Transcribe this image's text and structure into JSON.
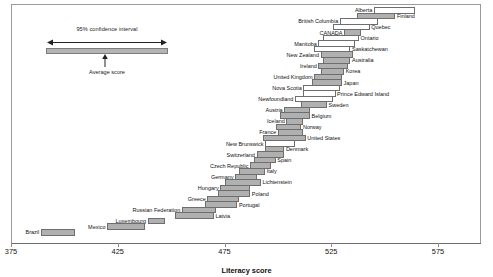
{
  "chart_data": {
    "type": "bar",
    "title": "",
    "subtitle": "",
    "xlabel": "Literacy score",
    "ylabel": "",
    "xlim": [
      375,
      585
    ],
    "xticks": [
      375,
      425,
      475,
      525,
      575
    ],
    "xticklabels": [
      "375",
      "425",
      "475",
      "525",
      "575"
    ],
    "grid": false,
    "legend_position": "top-left",
    "orientation": "horizontal",
    "value_encoding": "95% confidence interval band around average score",
    "legend": {
      "ci_label": "95% confidence interval",
      "avg_label": "Average score"
    },
    "categories": [
      "Alberta",
      "Finland",
      "British Columbia",
      "Quebec",
      "CANADA",
      "Ontario",
      "Manitoba",
      "Saskatchewan",
      "New Zealand",
      "Australia",
      "Ireland",
      "Korea",
      "United Kingdom",
      "Japan",
      "Nova Scotia",
      "Prince Edward Island",
      "Newfoundland",
      "Sweden",
      "Austria",
      "Belgium",
      "Iceland",
      "Norway",
      "France",
      "United States",
      "New Brunswick",
      "Denmark",
      "Switzerland",
      "Spain",
      "Czech Republic",
      "Italy",
      "Germany",
      "Lichtenstein",
      "Hungary",
      "Poland",
      "Greece",
      "Portugal",
      "Russian Federation",
      "Latvia",
      "Luxembourg",
      "Mexico",
      "Brazil"
    ],
    "series": [
      {
        "name": "Literacy score (95% CI)",
        "points": [
          {
            "label": "Alberta",
            "low": 545,
            "high": 564,
            "mean": 554.5,
            "style": "light",
            "label_side": "left"
          },
          {
            "label": "Finland",
            "low": 537,
            "high": 555,
            "mean": 546.0,
            "style": "dark",
            "label_side": "right"
          },
          {
            "label": "British Columbia",
            "low": 529,
            "high": 547,
            "mean": 538.0,
            "style": "light",
            "label_side": "left"
          },
          {
            "label": "Quebec",
            "low": 526,
            "high": 543,
            "mean": 534.5,
            "style": "light",
            "label_side": "right"
          },
          {
            "label": "CANADA",
            "low": 531,
            "high": 539,
            "mean": 535.0,
            "style": "dark",
            "label_side": "left"
          },
          {
            "label": "Ontario",
            "low": 521,
            "high": 538,
            "mean": 529.5,
            "style": "light",
            "label_side": "right"
          },
          {
            "label": "Manitoba",
            "low": 519,
            "high": 536,
            "mean": 527.5,
            "style": "light",
            "label_side": "left"
          },
          {
            "label": "Saskatchewan",
            "low": 517,
            "high": 534,
            "mean": 525.5,
            "style": "light",
            "label_side": "right"
          },
          {
            "label": "New Zealand",
            "low": 520,
            "high": 535,
            "mean": 527.5,
            "style": "dark",
            "label_side": "left"
          },
          {
            "label": "Australia",
            "low": 521,
            "high": 534,
            "mean": 527.5,
            "style": "dark",
            "label_side": "right"
          },
          {
            "label": "Ireland",
            "low": 519,
            "high": 533,
            "mean": 526.0,
            "style": "dark",
            "label_side": "left"
          },
          {
            "label": "Korea",
            "low": 520,
            "high": 531,
            "mean": 525.5,
            "style": "dark",
            "label_side": "right"
          },
          {
            "label": "United Kingdom",
            "low": 517,
            "high": 530,
            "mean": 523.5,
            "style": "dark",
            "label_side": "left"
          },
          {
            "label": "Japan",
            "low": 516,
            "high": 530,
            "mean": 523.0,
            "style": "dark",
            "label_side": "right"
          },
          {
            "label": "Nova Scotia",
            "low": 512,
            "high": 529,
            "mean": 520.5,
            "style": "light",
            "label_side": "left"
          },
          {
            "label": "Prince Edward Island",
            "low": 512,
            "high": 527,
            "mean": 519.5,
            "style": "light",
            "label_side": "right"
          },
          {
            "label": "Newfoundland",
            "low": 508,
            "high": 526,
            "mean": 517.0,
            "style": "light",
            "label_side": "left"
          },
          {
            "label": "Sweden",
            "low": 511,
            "high": 523,
            "mean": 517.0,
            "style": "dark",
            "label_side": "right"
          },
          {
            "label": "Austria",
            "low": 503,
            "high": 515,
            "mean": 509.0,
            "style": "dark",
            "label_side": "left"
          },
          {
            "label": "Belgium",
            "low": 501,
            "high": 515,
            "mean": 508.0,
            "style": "dark",
            "label_side": "right"
          },
          {
            "label": "Iceland",
            "low": 504,
            "high": 512,
            "mean": 508.0,
            "style": "dark",
            "label_side": "left"
          },
          {
            "label": "Norway",
            "low": 499,
            "high": 511,
            "mean": 505.0,
            "style": "dark",
            "label_side": "right"
          },
          {
            "label": "France",
            "low": 500,
            "high": 512,
            "mean": 506.0,
            "style": "dark",
            "label_side": "left"
          },
          {
            "label": "United States",
            "low": 493,
            "high": 513,
            "mean": 503.0,
            "style": "dark",
            "label_side": "right"
          },
          {
            "label": "New Brunswick",
            "low": 494,
            "high": 508,
            "mean": 501.0,
            "style": "light",
            "label_side": "left"
          },
          {
            "label": "Denmark",
            "low": 494,
            "high": 503,
            "mean": 498.5,
            "style": "dark",
            "label_side": "right"
          },
          {
            "label": "Switzerland",
            "low": 490,
            "high": 503,
            "mean": 496.5,
            "style": "dark",
            "label_side": "left"
          },
          {
            "label": "Spain",
            "low": 489,
            "high": 499,
            "mean": 494.0,
            "style": "dark",
            "label_side": "right"
          },
          {
            "label": "Czech Republic",
            "low": 487,
            "high": 497,
            "mean": 492.0,
            "style": "dark",
            "label_side": "left"
          },
          {
            "label": "Italy",
            "low": 482,
            "high": 494,
            "mean": 488.0,
            "style": "dark",
            "label_side": "right"
          },
          {
            "label": "Germany",
            "low": 480,
            "high": 490,
            "mean": 485.0,
            "style": "dark",
            "label_side": "left"
          },
          {
            "label": "Lichtenstein",
            "low": 475,
            "high": 492,
            "mean": 483.5,
            "style": "dark",
            "label_side": "right"
          },
          {
            "label": "Hungary",
            "low": 473,
            "high": 487,
            "mean": 480.0,
            "style": "dark",
            "label_side": "left"
          },
          {
            "label": "Poland",
            "low": 472,
            "high": 487,
            "mean": 479.5,
            "style": "dark",
            "label_side": "right"
          },
          {
            "label": "Greece",
            "low": 467,
            "high": 482,
            "mean": 474.5,
            "style": "dark",
            "label_side": "left"
          },
          {
            "label": "Portugal",
            "low": 466,
            "high": 481,
            "mean": 473.5,
            "style": "dark",
            "label_side": "right"
          },
          {
            "label": "Russian Federation",
            "low": 455,
            "high": 471,
            "mean": 463.0,
            "style": "dark",
            "label_side": "left"
          },
          {
            "label": "Latvia",
            "low": 452,
            "high": 470,
            "mean": 461.0,
            "style": "dark",
            "label_side": "right"
          },
          {
            "label": "Luxembourg",
            "low": 439,
            "high": 447,
            "mean": 443.0,
            "style": "dark",
            "label_side": "left"
          },
          {
            "label": "Mexico",
            "low": 420,
            "high": 438,
            "mean": 429.0,
            "style": "dark",
            "label_side": "left"
          },
          {
            "label": "Brazil",
            "low": 389,
            "high": 405,
            "mean": 397.0,
            "style": "dark",
            "label_side": "left"
          }
        ]
      }
    ]
  }
}
